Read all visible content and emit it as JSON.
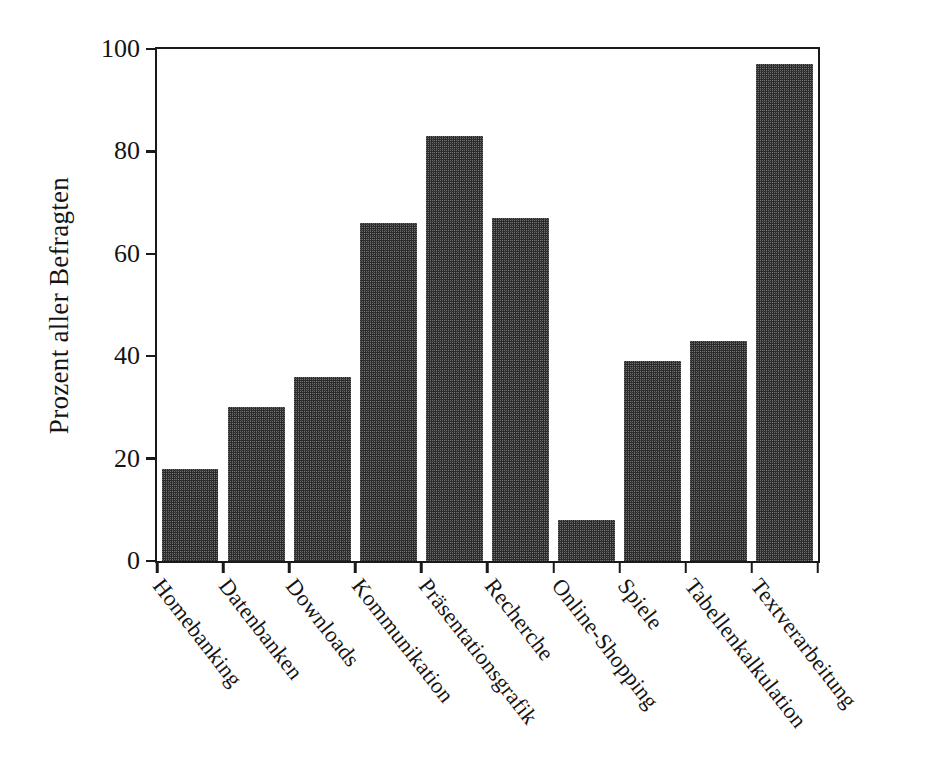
{
  "chart_data": {
    "type": "bar",
    "title": "",
    "subtitle": "",
    "xlabel": "",
    "ylabel": "Prozent aller Befragten",
    "ylim": [
      0,
      100
    ],
    "xlim_categories": 10,
    "grid": false,
    "legend": null,
    "y_ticks": [
      "0",
      "20",
      "40",
      "60",
      "80",
      "100"
    ],
    "y_tick_values": [
      0,
      20,
      40,
      60,
      80,
      100
    ],
    "categories": [
      "Homebanking",
      "Datenbanken",
      "Downloads",
      "Kommunikation",
      "Präsentationsgrafik",
      "Recherche",
      "Online-Shopping",
      "Spiele",
      "Tabellenkalkulation",
      "Textverarbeitung"
    ],
    "values": [
      18,
      30,
      36,
      66,
      83,
      67,
      8,
      39,
      43,
      97
    ],
    "bar_color": "#2b2b2b",
    "axis_color": "#1a1a1a",
    "background_color": "#ffffff"
  }
}
